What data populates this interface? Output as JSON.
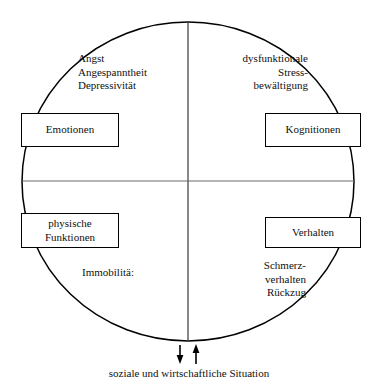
{
  "figure": {
    "colors": {
      "stroke": "#000000",
      "divider": "#555555",
      "text": "#101010",
      "background": "#ffffff"
    },
    "circle": {
      "center_x": 188,
      "center_y": 181,
      "radius_x": 166,
      "radius_y": 160
    },
    "quadrant_labels": {
      "top_left": "Angst\nAngespanntheit\nDepressivität",
      "top_right": "dysfunktionale\nStress-\nbewältigung",
      "bottom_left": "Immobilitä:",
      "bottom_right": "Schmerz-\nverhalten\nRückzug"
    },
    "boxes": {
      "emotionen": "Emotionen",
      "kognitionen": "Kognitionen",
      "physische_funktionen": "physische\nFunktionen",
      "verhalten": "Verhalten"
    },
    "arrows": {
      "down_arrow": "arrow-down-icon",
      "up_arrow": "arrow-up-icon"
    },
    "caption": "soziale und wirtschaftliche Situation"
  }
}
